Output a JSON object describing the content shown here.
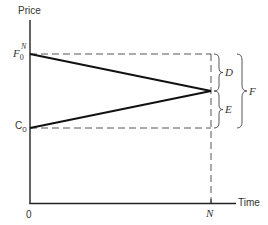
{
  "diagram": {
    "axes": {
      "y_label": "Price",
      "x_label": "Time",
      "origin_label": "0",
      "x_end_label": "N"
    },
    "y_markers": {
      "top": {
        "main": "F",
        "sub": "0",
        "sup": "N"
      },
      "bottom": {
        "main": "C",
        "sub": "0"
      }
    },
    "braces": {
      "upper": "D",
      "lower": "E",
      "outer": "F"
    },
    "lines": {
      "futures_path": {
        "from": "F0^N at time 0",
        "to": "convergence at time N"
      },
      "spot_path": {
        "from": "C0 at time 0",
        "to": "convergence at time N"
      }
    }
  }
}
